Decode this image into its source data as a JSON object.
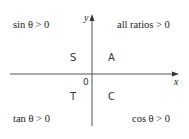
{
  "diagram": {
    "axes": {
      "x_label": "x",
      "y_label": "y",
      "origin_label": "0",
      "color": "#555555"
    },
    "quadrants": [
      {
        "id": "I",
        "letter": "A",
        "statement": "all ratios > 0"
      },
      {
        "id": "II",
        "letter": "S",
        "statement": "sin θ > 0"
      },
      {
        "id": "III",
        "letter": "T",
        "statement": "tan θ > 0"
      },
      {
        "id": "IV",
        "letter": "C",
        "statement": "cos θ > 0"
      }
    ]
  }
}
